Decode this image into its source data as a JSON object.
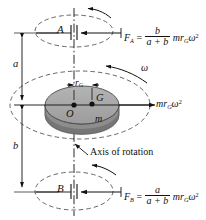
{
  "figure": {
    "axis_label": "Axis of rotation",
    "colors": {
      "line": "#111111",
      "disk_face": "#a8a8a8",
      "disk_edge": "#7d7d7d",
      "disk_side": "#8f8f8f",
      "background": "#ffffff"
    }
  },
  "labels": {
    "bearing_a": "A",
    "bearing_b": "B",
    "center_o": "O",
    "center_g": "G",
    "mass": "m",
    "radius_g": "r",
    "radius_g_sub": "G",
    "dim_a": "a",
    "dim_b": "b",
    "omega": "ω",
    "axis_of_rotation": "Axis of rotation"
  },
  "forces": {
    "inertia_force": {
      "m": "m",
      "r": "r",
      "r_sub": "G",
      "omega": "ω",
      "exp": "2"
    },
    "fa": {
      "name": "F",
      "sub": "A",
      "equals": "=",
      "numerator": "b",
      "denominator": "a + b",
      "tail_m": "m",
      "tail_r": "r",
      "tail_r_sub": "G",
      "tail_omega": "ω",
      "tail_exp": "2"
    },
    "fb": {
      "name": "F",
      "sub": "B",
      "equals": "=",
      "numerator": "a",
      "denominator": "a + b",
      "tail_m": "m",
      "tail_r": "r",
      "tail_r_sub": "G",
      "tail_omega": "ω",
      "tail_exp": "2"
    }
  }
}
